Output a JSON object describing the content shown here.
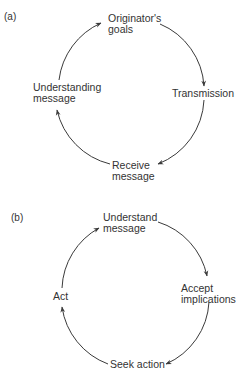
{
  "figure": {
    "panels": [
      {
        "id": "a",
        "label": "(a)",
        "nodes": [
          {
            "line1": "Originator's",
            "line2": "goals"
          },
          {
            "line1": "Transmission",
            "line2": ""
          },
          {
            "line1": "Receive",
            "line2": "message"
          },
          {
            "line1": "Understanding",
            "line2": "message"
          }
        ],
        "flow_direction": "clockwise",
        "edges": [
          {
            "from": "Originator's goals",
            "to": "Transmission"
          },
          {
            "from": "Transmission",
            "to": "Receive message"
          },
          {
            "from": "Receive message",
            "to": "Understanding message"
          },
          {
            "from": "Understanding message",
            "to": "Originator's goals"
          }
        ]
      },
      {
        "id": "b",
        "label": "(b)",
        "nodes": [
          {
            "line1": "Understand",
            "line2": "message"
          },
          {
            "line1": "Accept",
            "line2": "implications"
          },
          {
            "line1": "Seek action",
            "line2": ""
          },
          {
            "line1": "Act",
            "line2": ""
          }
        ],
        "flow_direction": "clockwise",
        "edges": [
          {
            "from": "Understand message",
            "to": "Accept implications"
          },
          {
            "from": "Accept implications",
            "to": "Seek action"
          },
          {
            "from": "Seek action",
            "to": "Act"
          },
          {
            "from": "Act",
            "to": "Understand message"
          }
        ]
      }
    ],
    "colors": {
      "line": "#3a3a3a",
      "text": "#333333",
      "background": "#ffffff"
    }
  }
}
